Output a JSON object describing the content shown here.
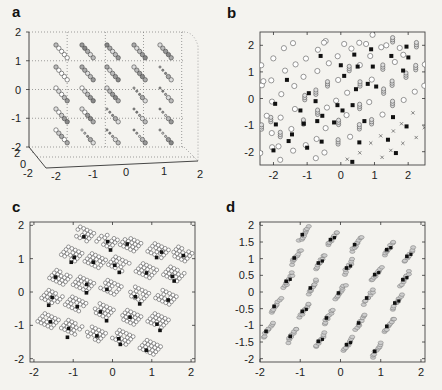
{
  "figure": {
    "panels": [
      "a",
      "b",
      "c",
      "d"
    ]
  },
  "chart_data": [
    {
      "panel": "a",
      "type": "scatter",
      "title": "",
      "projection": "3d",
      "xlabel": "",
      "ylabel": "",
      "zlabel": "",
      "x_ticks": [
        "-2",
        "-1",
        "0",
        "1",
        "2"
      ],
      "y_ticks": [
        "-2",
        "0",
        "2"
      ],
      "z_ticks": [
        "-2",
        "-1",
        "0",
        "1",
        "2"
      ],
      "xlim": [
        -2,
        2
      ],
      "ylim": [
        -2,
        2
      ],
      "zlim": [
        -2,
        2
      ],
      "grid": true,
      "description": "5x5 lattice of diagonal clusters, each a short line of 4-5 circle markers ranging from open to gray-filled",
      "cluster_grid": {
        "cols": [
          -1.6,
          -0.8,
          0.0,
          0.8,
          1.6
        ],
        "rows": [
          1.2,
          0.5,
          -0.2,
          -0.9,
          -1.6
        ]
      },
      "marker_types": [
        "open-circle",
        "gray-circle",
        "small-dot"
      ]
    },
    {
      "panel": "b",
      "type": "scatter",
      "title": "",
      "xlabel": "",
      "ylabel": "",
      "x_ticks": [
        "-2",
        "-1",
        "0",
        "1",
        "2"
      ],
      "y_ticks": [
        "-2",
        "-1",
        "0",
        "1",
        "2"
      ],
      "xlim": [
        -2.4,
        2.5
      ],
      "ylim": [
        -2.5,
        2.5
      ],
      "grid": false,
      "description": "Overlapping diagonal point bands of open circles, gray stacked circles, crosses and filled black squares",
      "marker_types": [
        "open-circle",
        "stacked-gray-circle",
        "cross",
        "black-square"
      ]
    },
    {
      "panel": "c",
      "type": "scatter",
      "title": "",
      "xlabel": "",
      "ylabel": "",
      "x_ticks": [
        "-2",
        "-1",
        "0",
        "1",
        "2"
      ],
      "y_ticks": [
        "-2",
        "-1",
        "0",
        "1",
        "2"
      ],
      "xlim": [
        -2.1,
        2.1
      ],
      "ylim": [
        -2.1,
        2.1
      ],
      "grid": false,
      "description": "5x5 lattice of rhombic clusters of open circles with 1-2 filled black squares each",
      "cluster_centers": [
        [
          -0.8,
          1.6
        ],
        [
          -0.2,
          1.4
        ],
        [
          0.4,
          1.3
        ],
        [
          1.1,
          1.1
        ],
        [
          1.7,
          1.0
        ],
        [
          -1.1,
          1.0
        ],
        [
          -0.5,
          0.8
        ],
        [
          0.1,
          0.7
        ],
        [
          0.8,
          0.5
        ],
        [
          1.5,
          0.4
        ],
        [
          -1.4,
          0.3
        ],
        [
          -0.8,
          0.1
        ],
        [
          -0.1,
          0.0
        ],
        [
          0.6,
          -0.2
        ],
        [
          1.3,
          -0.3
        ],
        [
          -1.6,
          -0.3
        ],
        [
          -1.0,
          -0.5
        ],
        [
          -0.3,
          -0.7
        ],
        [
          0.4,
          -0.9
        ],
        [
          1.1,
          -1.0
        ],
        [
          -1.7,
          -1.0
        ],
        [
          -1.1,
          -1.2
        ],
        [
          -0.5,
          -1.4
        ],
        [
          0.2,
          -1.5
        ],
        [
          0.9,
          -1.8
        ]
      ],
      "marker_types": [
        "open-circle",
        "black-square"
      ]
    },
    {
      "panel": "d",
      "type": "scatter",
      "title": "",
      "xlabel": "",
      "ylabel": "",
      "x_ticks": [
        "-2",
        "-1",
        "0",
        "1",
        "2"
      ],
      "y_ticks": [
        "-2",
        "-1.5",
        "-1",
        "-0.5",
        "0",
        "0.5",
        "1",
        "1.5",
        "2"
      ],
      "xlim": [
        -2,
        2.1
      ],
      "ylim": [
        -2.1,
        2.1
      ],
      "grid": false,
      "description": "5x5 lattice of tight elongated diagonal clusters of gray circles with black squares",
      "cluster_centers": [
        [
          -0.9,
          1.75
        ],
        [
          -0.2,
          1.6
        ],
        [
          0.4,
          1.45
        ],
        [
          1.2,
          1.3
        ],
        [
          1.7,
          1.1
        ],
        [
          -1.1,
          1.05
        ],
        [
          -0.5,
          0.9
        ],
        [
          0.2,
          0.75
        ],
        [
          0.9,
          0.55
        ],
        [
          1.6,
          0.4
        ],
        [
          -1.3,
          0.35
        ],
        [
          -0.7,
          0.15
        ],
        [
          0.0,
          0.0
        ],
        [
          0.7,
          -0.15
        ],
        [
          1.4,
          -0.3
        ],
        [
          -1.6,
          -0.4
        ],
        [
          -0.9,
          -0.55
        ],
        [
          -0.3,
          -0.75
        ],
        [
          0.5,
          -0.9
        ],
        [
          1.2,
          -1.0
        ],
        [
          -1.8,
          -1.15
        ],
        [
          -1.2,
          -1.3
        ],
        [
          -0.5,
          -1.45
        ],
        [
          0.2,
          -1.55
        ],
        [
          0.9,
          -1.75
        ]
      ],
      "marker_types": [
        "gray-circle",
        "black-square"
      ]
    }
  ]
}
